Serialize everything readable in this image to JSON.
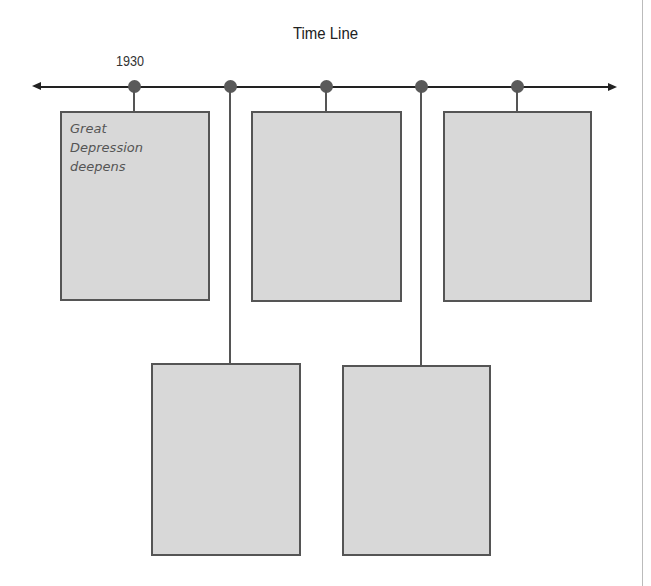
{
  "title": "Time Line",
  "timeline": {
    "start_label": "1930",
    "colors": {
      "axis": "#222222",
      "dot": "#5a5a5a",
      "box_fill": "#d8d8d8",
      "box_border": "#555555"
    },
    "events": [
      {
        "position": "top",
        "text": "Great\nDepression\ndeepens"
      },
      {
        "position": "bottom",
        "text": ""
      },
      {
        "position": "top",
        "text": ""
      },
      {
        "position": "bottom",
        "text": ""
      },
      {
        "position": "top",
        "text": ""
      }
    ]
  }
}
